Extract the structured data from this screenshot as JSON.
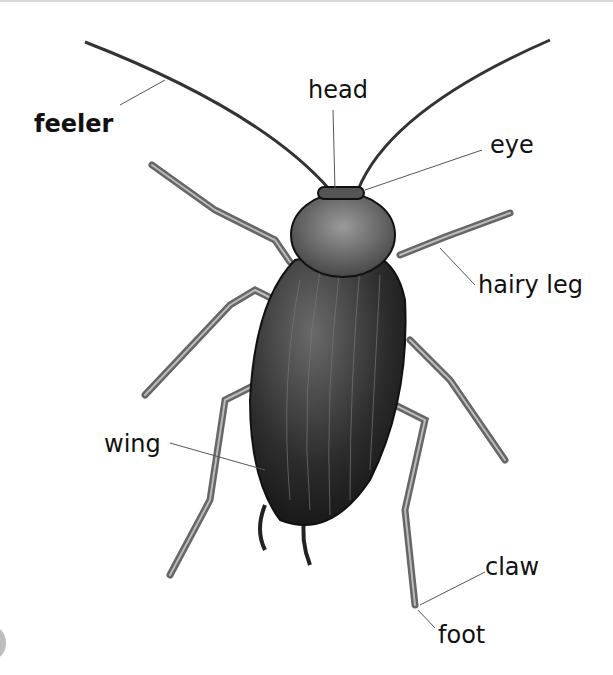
{
  "diagram": {
    "labels": {
      "feeler": "feeler",
      "head": "head",
      "eye": "eye",
      "hairy_leg": "hairy leg",
      "wing": "wing",
      "claw": "claw",
      "foot": "foot"
    },
    "colors": {
      "background": "#ffffff",
      "body": "#2a2a2a",
      "leg": "#8a8a8a",
      "leader_line": "#555555"
    }
  }
}
